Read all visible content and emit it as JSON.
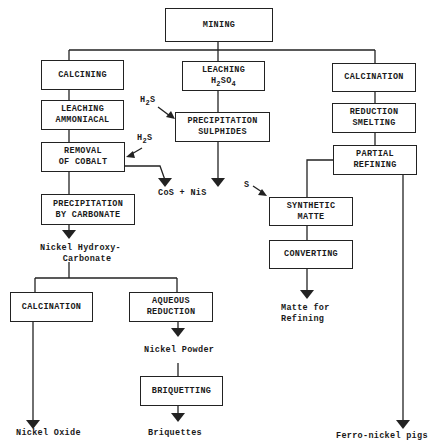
{
  "diagram": {
    "type": "process-flowchart",
    "root": {
      "label": "MINING"
    },
    "branches": {
      "left": {
        "steps": [
          {
            "id": "calcining",
            "label": "CALCINING"
          },
          {
            "id": "leaching_ammoniacal",
            "line1": "LEACHING",
            "line2": "AMMONIACAL"
          },
          {
            "id": "removal_cobalt",
            "line1": "REMOVAL",
            "line2": "OF COBALT",
            "reagent": {
              "main": "H",
              "sub": "2",
              "tail": "S"
            },
            "byproduct": "CoS + NiS"
          },
          {
            "id": "precipitation_carbonate",
            "line1": "PRECIPITATION",
            "line2": "BY CARBONATE"
          }
        ],
        "intermediate": {
          "line1": "Nickel Hydroxy-",
          "line2": "Carbonate"
        },
        "sub_branches": [
          {
            "id": "calcination_bottom",
            "label": "CALCINATION",
            "product": "Nickel Oxide"
          },
          {
            "id": "aqueous_reduction",
            "line1": "AQUEOUS",
            "line2": "REDUCTION",
            "intermediate": "Nickel Powder",
            "next": {
              "id": "briquetting",
              "label": "BRIQUETTING",
              "product": "Briquettes"
            }
          }
        ]
      },
      "middle": {
        "steps": [
          {
            "id": "leaching_h2so4",
            "line1": "LEACHING",
            "formula": {
              "a": "H",
              "a_sub": "2",
              "b": "SO",
              "b_sub": "4"
            }
          },
          {
            "id": "precipitation_sulphides",
            "line1": "PRECIPITATION",
            "line2": "SULPHIDES",
            "reagent": {
              "main": "H",
              "sub": "2",
              "tail": "S"
            }
          }
        ],
        "product": "CoS + NiS"
      },
      "right": {
        "steps": [
          {
            "id": "calcination_right",
            "label": "CALCINATION"
          },
          {
            "id": "reduction_smelting",
            "line1": "REDUCTION",
            "line2": "SMELTING"
          },
          {
            "id": "partial_refining",
            "line1": "PARTIAL",
            "line2": "REFINING"
          }
        ],
        "product": "Ferro-nickel pigs",
        "sub_branch": {
          "reagent": "S",
          "steps": [
            {
              "id": "synthetic_matte",
              "line1": "SYNTHETIC",
              "line2": "MATTE"
            },
            {
              "id": "converting",
              "label": "CONVERTING"
            }
          ],
          "product": {
            "line1": "Matte for",
            "line2": "Refining"
          }
        }
      }
    },
    "colors": {
      "stroke": "#222222",
      "background": "#ffffff",
      "text": "#1a1a1a"
    }
  }
}
